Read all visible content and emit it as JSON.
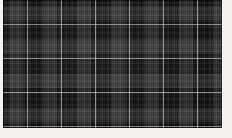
{
  "image": {
    "kind": "textile-swatch-photo",
    "subject": "tartan plaid fabric",
    "caption": "",
    "alt_text": "Dark grey and black tartan plaid woven fabric swatch"
  },
  "canvas": {
    "width_px": 232,
    "height_px": 138,
    "background_color": "#f4f3f1"
  },
  "swatch": {
    "x_px": 3,
    "y_px": 0,
    "width_px": 219,
    "height_px": 128,
    "ground_color": "#0a0a0a"
  },
  "pattern": {
    "type": "tartan",
    "sett_period_x_px": 34,
    "sett_period_y_px": 34,
    "symmetry": "symmetric-sett",
    "colors": {
      "ground_black": "#0a0a0a",
      "band_dark_grey": "#242424",
      "band_mid_grey": "#3a3a3a",
      "rib_grey": "#1c1c1c",
      "accent_white": "#e8e8e8"
    },
    "warp_stripes": [
      {
        "name": "black-block",
        "width_px": 6,
        "color": "#0a0a0a"
      },
      {
        "name": "mid-grey-band",
        "width_px": 14,
        "color": "#3a3a3a"
      },
      {
        "name": "black-block-2",
        "width_px": 4,
        "color": "#0a0a0a"
      },
      {
        "name": "white-guide-line",
        "width_px": 1,
        "color": "#e8e8e8"
      },
      {
        "name": "black-block-3",
        "width_px": 9,
        "color": "#0a0a0a"
      }
    ],
    "weft_stripes": [
      {
        "name": "black-block",
        "height_px": 6,
        "color": "#0a0a0a"
      },
      {
        "name": "mid-grey-band",
        "height_px": 14,
        "color": "#3a3a3a"
      },
      {
        "name": "black-block-2",
        "height_px": 4,
        "color": "#0a0a0a"
      },
      {
        "name": "white-guide-line",
        "height_px": 1,
        "color": "#e8e8e8"
      },
      {
        "name": "black-block-3",
        "height_px": 9,
        "color": "#0a0a0a"
      }
    ],
    "white_line_positions_x_px": [
      27,
      61,
      95,
      129,
      163,
      197
    ],
    "white_line_positions_y_px": [
      24,
      58,
      92,
      126
    ],
    "rib_pitch_px": 6,
    "weave": "twill",
    "thread_pitch_px": 2
  },
  "labels": {
    "title": "",
    "note": ""
  }
}
